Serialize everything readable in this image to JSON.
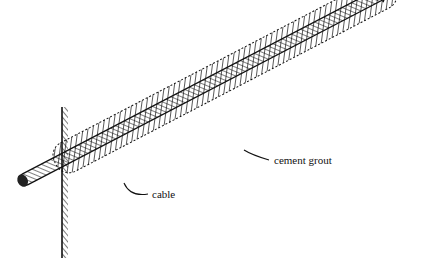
{
  "diagram": {
    "type": "cable anchor in cement grout",
    "labels": {
      "grout": "cement grout",
      "cable": "cable"
    },
    "colors": {
      "ink": "#111111",
      "background": "#ffffff"
    }
  }
}
